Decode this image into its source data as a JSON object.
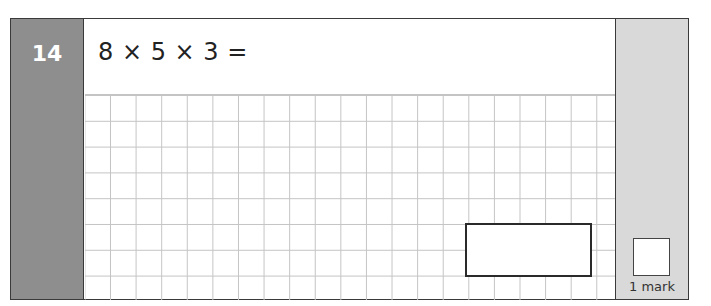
{
  "question": {
    "number": "14",
    "expression": "8 × 5 × 3 =",
    "grid": {
      "columns": 21,
      "rows": 8
    },
    "answer_box": {
      "value": ""
    }
  },
  "marks": {
    "label": "1 mark",
    "box_value": ""
  },
  "colors": {
    "number_panel": "#8e8e8e",
    "mark_panel": "#d9d9d9",
    "grid_line": "#c4c4c4",
    "border": "#3a3a3a"
  }
}
